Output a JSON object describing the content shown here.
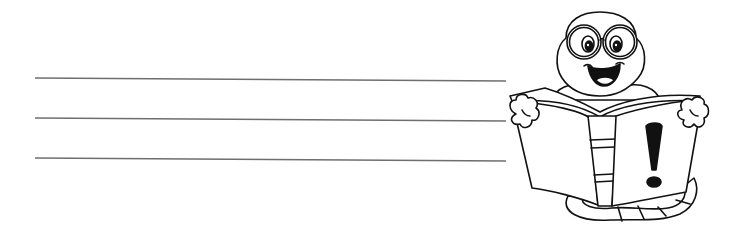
{
  "worksheet": {
    "background": "#ffffff",
    "line_color": "#6e6e6e",
    "lines": [
      {
        "x1": 35,
        "y1": 78,
        "x2": 506,
        "y2": 81
      },
      {
        "x1": 35,
        "y1": 118,
        "x2": 506,
        "y2": 121
      },
      {
        "x1": 35,
        "y1": 158,
        "x2": 506,
        "y2": 161
      }
    ]
  },
  "illustration": {
    "subject": "bookworm reading an open book",
    "book_symbol": "!",
    "stroke_color": "#111111",
    "fill_color": "#ffffff"
  }
}
